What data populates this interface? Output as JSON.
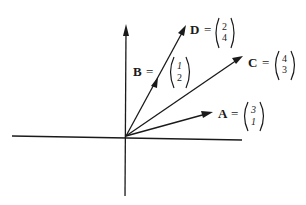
{
  "diagram": {
    "type": "vector-diagram",
    "origin_px": [
      126,
      136
    ],
    "axes": {
      "x_axis": "horizontal",
      "y_axis": "vertical",
      "y_arrow": true
    },
    "vectors": [
      {
        "name": "A",
        "label": "A",
        "equals": "=",
        "top": "3",
        "bottom": "1",
        "components": [
          3,
          1
        ]
      },
      {
        "name": "B",
        "label": "B",
        "equals": "=",
        "top": "1",
        "bottom": "2",
        "components": [
          1,
          2
        ]
      },
      {
        "name": "C",
        "label": "C",
        "equals": "=",
        "top": "4",
        "bottom": "3",
        "components": [
          4,
          3
        ]
      },
      {
        "name": "D",
        "label": "D",
        "equals": "=",
        "top": "2",
        "bottom": "4",
        "components": [
          2,
          4
        ]
      }
    ],
    "colors": {
      "ink": "#1a1a1a",
      "background": "#ffffff"
    }
  }
}
